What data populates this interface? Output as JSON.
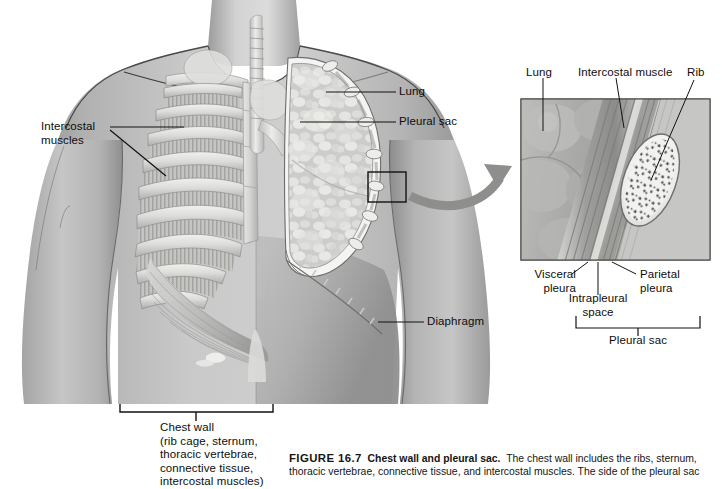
{
  "figure": {
    "number": "FIGURE 16.7",
    "title": "Chest wall and pleural sac.",
    "body": "The chest wall includes the ribs, sternum, thoracic vertebrae, connective tissue, and intercostal muscles. The side of the pleural sac attached to the lung is"
  },
  "main_diagram": {
    "name": "anterior-thorax-cutaway",
    "labels": {
      "intercostal_muscles": "Intercostal\nmuscles",
      "lung": "Lung",
      "pleural_sac": "Pleural sac",
      "diaphragm": "Diaphragm",
      "chest_wall": "Chest wall\n(rib cage, sternum,\nthoracic vertebrae,\nconnective tissue,\nintercostal muscles)"
    }
  },
  "inset_diagram": {
    "name": "pleural-sac-detail",
    "labels": {
      "lung": "Lung",
      "intercostal_muscle": "Intercostal muscle",
      "rib": "Rib",
      "visceral_pleura": "Visceral\npleura",
      "parietal_pleura": "Parietal\npleura",
      "intrapleural_space": "Intrapleural\nspace",
      "pleural_sac": "Pleural sac"
    }
  },
  "colors": {
    "background": "#ffffff",
    "skin_light": "#c9c9c9",
    "skin_mid": "#a8a8a8",
    "skin_dark": "#8a8a8a",
    "bone_light": "#e8e8e6",
    "bone_mid": "#c4c4c2",
    "lung_light": "#dcdcda",
    "lung_mid": "#b8b8b6",
    "line": "#111111",
    "text": "#0d0d0d"
  }
}
